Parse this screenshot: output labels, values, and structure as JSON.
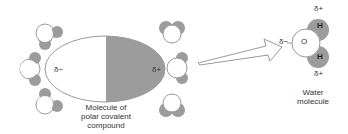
{
  "diagram": {
    "type": "molecular-interaction",
    "colors": {
      "outline": "#9a9a9a",
      "shade": "#9c9c9c",
      "background": "#ffffff",
      "text": "#333333"
    },
    "polar_molecule": {
      "negative_label": "δ−",
      "positive_label": "δ+",
      "caption_line1": "Molecule of",
      "caption_line2": "polar covalent",
      "caption_line3": "compound"
    },
    "water_molecule": {
      "oxygen_label": "O",
      "hydrogen_top_label": "H",
      "hydrogen_bottom_label": "H",
      "oxygen_charge": "δ−",
      "hydrogen_top_charge": "δ+",
      "hydrogen_bottom_charge": "δ+",
      "caption_line1": "Water",
      "caption_line2": "molecule"
    },
    "surrounding_water_molecules": {
      "left_count": 3,
      "right_count": 3
    }
  }
}
